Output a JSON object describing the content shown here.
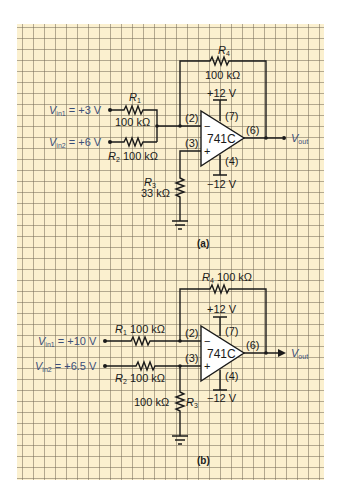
{
  "figure": {
    "background": "#fbf0cf",
    "grid_color": "#8a806a",
    "ink_color": "#1a1a1a",
    "label_color": "#3b4f7a"
  },
  "panel_a": {
    "caption": "(a)",
    "vin1": {
      "name": "V",
      "sub": "in1",
      "value": " = +3 V"
    },
    "vin2": {
      "name": "V",
      "sub": "in2",
      "value": " = +6 V"
    },
    "r1": {
      "name": "R",
      "sub": "1",
      "value": "100 kΩ"
    },
    "r2": {
      "name": "R",
      "sub": "2",
      "value": "100 kΩ"
    },
    "r3": {
      "name": "R",
      "sub": "3",
      "value": "33 kΩ"
    },
    "r4": {
      "name": "R",
      "sub": "4",
      "value": "100 kΩ"
    },
    "opamp": {
      "model": "741C",
      "pin_inv": "(2)",
      "pin_noninv": "(3)",
      "pin_vpos": "(7)",
      "pin_vneg": "(4)",
      "pin_out": "(6)",
      "minus": "−",
      "plus": "+"
    },
    "vpos": "+12 V",
    "vneg": "−12 V",
    "vout": {
      "name": "V",
      "sub": "out"
    }
  },
  "panel_b": {
    "caption": "(b)",
    "vin1": {
      "name": "V",
      "sub": "in1",
      "value": " = +10 V"
    },
    "vin2": {
      "name": "V",
      "sub": "in2",
      "value": " = +6.5 V"
    },
    "r1": {
      "name": "R",
      "sub": "1",
      "value": "100 kΩ"
    },
    "r2": {
      "name": "R",
      "sub": "2",
      "value": "100 kΩ"
    },
    "r3": {
      "name": "R",
      "sub": "3",
      "value": "100 kΩ"
    },
    "r4": {
      "name": "R",
      "sub": "4",
      "value": "100 kΩ"
    },
    "opamp": {
      "model": "741C",
      "pin_inv": "(2)",
      "pin_noninv": "(3)",
      "pin_vpos": "(7)",
      "pin_vneg": "(4)",
      "pin_out": "(6)",
      "minus": "−",
      "plus": "+"
    },
    "vpos": "+12 V",
    "vneg": "−12 V",
    "vout": {
      "name": "V",
      "sub": "out"
    }
  }
}
